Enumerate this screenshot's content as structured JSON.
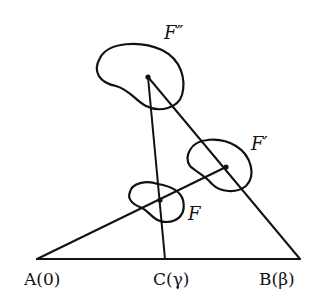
{
  "diagram": {
    "points": {
      "A": {
        "label": "A(0)",
        "x": 37,
        "y": 259
      },
      "C": {
        "label": "C(γ)",
        "x": 165,
        "y": 259
      },
      "B": {
        "label": "B(β)",
        "x": 300,
        "y": 259
      }
    },
    "figures": {
      "F": {
        "label": "F",
        "center_x": 160,
        "center_y": 200
      },
      "F_prime": {
        "label": "F′",
        "center_x": 226,
        "center_y": 167
      },
      "F_double_prime": {
        "label": "F″",
        "center_x": 148,
        "center_y": 77
      }
    },
    "colors": {
      "ink": "#111111",
      "background": "#ffffff"
    }
  }
}
